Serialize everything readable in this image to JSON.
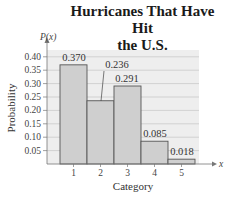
{
  "chart_data": {
    "type": "bar",
    "title": "Hurricanes That Have Hit the U.S.",
    "title_lines": [
      "Hurricanes That Have Hit",
      "the U.S."
    ],
    "xlabel": "Category",
    "ylabel": "Probability",
    "y_axis_symbol": "P(x)",
    "x_axis_symbol": "x",
    "categories": [
      "1",
      "2",
      "3",
      "4",
      "5"
    ],
    "values": [
      0.37,
      0.236,
      0.291,
      0.085,
      0.018
    ],
    "value_labels": [
      "0.370",
      "0.236",
      "0.291",
      "0.085",
      "0.018"
    ],
    "yticks": [
      "0.05",
      "0.10",
      "0.15",
      "0.20",
      "0.25",
      "0.30",
      "0.35",
      "0.40"
    ],
    "ylim": [
      0,
      0.42
    ],
    "grid": true,
    "bar_color": "#cfcfcf",
    "bar_edge_color": "#555555"
  }
}
